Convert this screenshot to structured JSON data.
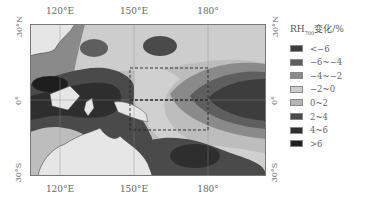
{
  "map": {
    "longitude_ticks": [
      "120°E",
      "150°E",
      "180°"
    ],
    "latitude_ticks": [
      "30°N",
      "0°",
      "30°S"
    ],
    "legend": {
      "title_main": "RH",
      "title_sub": "700",
      "title_suffix": "变化/%",
      "items": [
        {
          "label": "<−6",
          "color": "#3c3c3c"
        },
        {
          "label": "−6~−4",
          "color": "#5e5e5e"
        },
        {
          "label": "−4~−2",
          "color": "#8a8a8a"
        },
        {
          "label": "−2~0",
          "color": "#cdcdcd"
        },
        {
          "label": "0~2",
          "color": "#b4b4b4"
        },
        {
          "label": "2~4",
          "color": "#4a4a4a"
        },
        {
          "label": "4~6",
          "color": "#2e2e2e"
        },
        {
          "label": ">6",
          "color": "#1e1e1e"
        }
      ]
    },
    "colors": {
      "land": "#e6e6e6",
      "background_field": "#bdbdbd",
      "light_field": "#d0d0d0"
    }
  }
}
